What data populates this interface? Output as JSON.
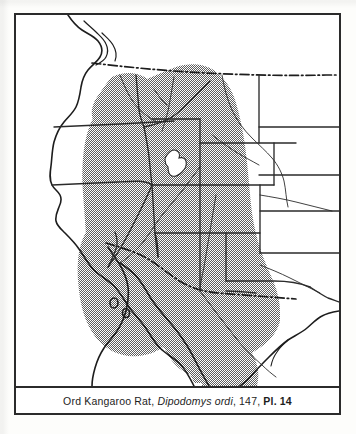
{
  "figure": {
    "kind": "species-range-map",
    "region_depicted": "Western United States",
    "caption": {
      "common_name": "Ord Kangaroo Rat",
      "scientific_name": "Dipodomys ordi",
      "page_number": "147",
      "plate_label": "Pl. 14",
      "separator_1": ", ",
      "separator_2": ", ",
      "separator_3": ", ",
      "full_text": "Ord Kangaroo Rat, Dipodomys ordi, 147, Pl. 14"
    },
    "colors": {
      "ink": "#2b2b2b",
      "paper": "#ffffff",
      "page": "#fdfdfb",
      "range_shading": "#8a8a8a",
      "range_shading_hatch": "#6f6f6f",
      "coastline": "#1d1d1d",
      "state_border": "#2b2b2b"
    },
    "legend_note": "Stippled gray area indicates the species range",
    "map": {
      "range_shading_pattern": "halftone-checker",
      "international_border_style": "dash-dot",
      "state_border_style": "solid",
      "lakes": [
        "Great Salt Lake"
      ],
      "features": [
        "Pacific coastline",
        "Gulf of California",
        "Baja California peninsula",
        "Gulf of Mexico coastline",
        "United States - Canada border",
        "United States - Mexico border"
      ]
    }
  }
}
